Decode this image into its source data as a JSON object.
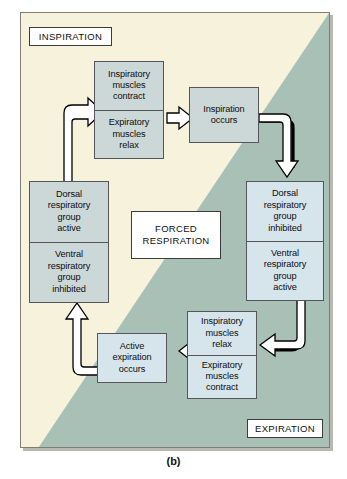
{
  "figure": {
    "caption": "(b)",
    "colors": {
      "inspiration_background": "#f7f2dc",
      "expiration_background": "#a8c0b6",
      "gray_box": "#ccd7d8",
      "blue_box": "#d6e4ec",
      "border": "#55555a",
      "arrow_fill": "#ffffff",
      "arrow_outline": "#000000"
    }
  },
  "labels": {
    "inspiration": "INSPIRATION",
    "expiration": "EXPIRATION",
    "center_line1": "FORCED",
    "center_line2": "RESPIRATION"
  },
  "boxes": {
    "inspiratory_muscles_contract": {
      "line1": "Inspiratory",
      "line2": "muscles",
      "line3": "contract"
    },
    "expiratory_muscles_relax": {
      "line1": "Expiratory",
      "line2": "muscles",
      "line3": "relax"
    },
    "inspiration_occurs": {
      "line1": "Inspiration",
      "line2": "occurs"
    },
    "dorsal_group_active": {
      "line1": "Dorsal",
      "line2": "respiratory",
      "line3": "group",
      "line4": "active"
    },
    "ventral_group_inhibited": {
      "line1": "Ventral",
      "line2": "respiratory",
      "line3": "group",
      "line4": "inhibited"
    },
    "dorsal_group_inhibited": {
      "line1": "Dorsal",
      "line2": "respiratory",
      "line3": "group",
      "line4": "inhibited"
    },
    "ventral_group_active": {
      "line1": "Ventral",
      "line2": "respiratory",
      "line3": "group",
      "line4": "active"
    },
    "inspiratory_muscles_relax": {
      "line1": "Inspiratory",
      "line2": "muscles",
      "line3": "relax"
    },
    "expiratory_muscles_contract": {
      "line1": "Expiratory",
      "line2": "muscles",
      "line3": "contract"
    },
    "active_expiration_occurs": {
      "line1": "Active",
      "line2": "expiration",
      "line3": "occurs"
    }
  }
}
